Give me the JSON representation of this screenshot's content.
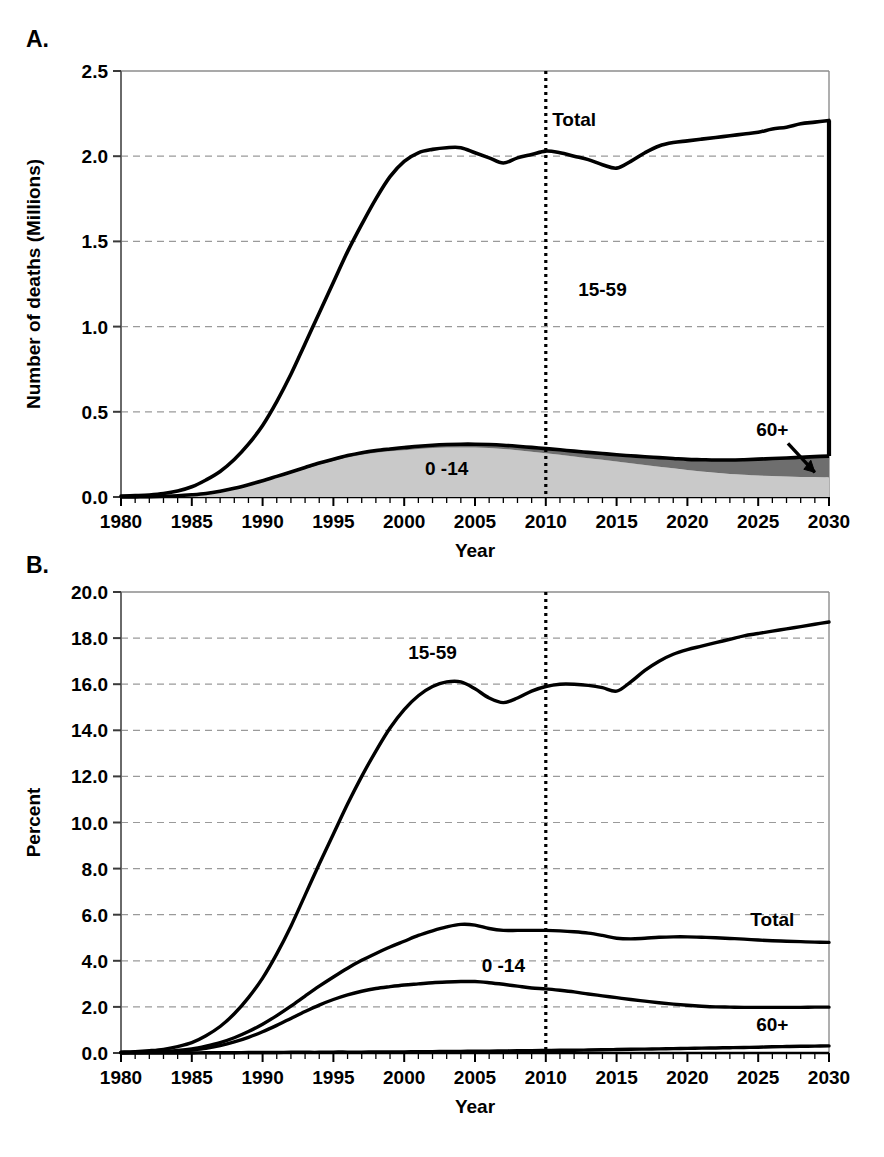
{
  "figure": {
    "background": "#ffffff",
    "line_color": "#000000",
    "grid_color": "#9a9a9a",
    "band_0_14_color": "#c9c9c9",
    "band_60plus_color": "#6e6e6e",
    "panels": [
      {
        "letter": "A."
      },
      {
        "letter": "B."
      }
    ]
  },
  "chart_data": [
    {
      "type": "area",
      "panel": "A.",
      "title": "",
      "xlabel": "Year",
      "ylabel": "Number of deaths (Millions)",
      "xlim": [
        1980,
        2030
      ],
      "ylim": [
        0.0,
        2.5
      ],
      "xticks": [
        1980,
        1985,
        1990,
        1995,
        2000,
        2005,
        2010,
        2015,
        2020,
        2025,
        2030
      ],
      "xticklabels": [
        "1980",
        "1985",
        "1990",
        "1995",
        "2000",
        "2005",
        "2010",
        "2015",
        "2020",
        "2025",
        "2030"
      ],
      "yticks": [
        0.0,
        0.5,
        1.0,
        1.5,
        2.0,
        2.5
      ],
      "yticklabels": [
        "0.0",
        "0.5",
        "1.0",
        "1.5",
        "2.0",
        "2.5"
      ],
      "minor_xtick_interval": 1,
      "grid": "horizontal-dashed",
      "legend": "inline-annotations",
      "annotations": [
        {
          "text": "Total",
          "x": 2012,
          "y": 2.18
        },
        {
          "text": "15-59",
          "x": 2014,
          "y": 1.18
        },
        {
          "text": "0 -14",
          "x": 2003,
          "y": 0.13
        },
        {
          "text": "60+",
          "x": 2026,
          "y": 0.36
        }
      ],
      "reference_line": {
        "x": 2010,
        "style": "dotted",
        "label": "2010"
      },
      "x": [
        1980,
        1981,
        1982,
        1983,
        1984,
        1985,
        1986,
        1987,
        1988,
        1989,
        1990,
        1991,
        1992,
        1993,
        1994,
        1995,
        1996,
        1997,
        1998,
        1999,
        2000,
        2001,
        2002,
        2003,
        2004,
        2005,
        2006,
        2007,
        2008,
        2009,
        2010,
        2011,
        2012,
        2013,
        2014,
        2015,
        2016,
        2017,
        2018,
        2019,
        2020,
        2021,
        2022,
        2023,
        2024,
        2025,
        2026,
        2027,
        2028,
        2029,
        2030
      ],
      "series": [
        {
          "name": "Total",
          "values": [
            0.005,
            0.008,
            0.012,
            0.02,
            0.035,
            0.06,
            0.1,
            0.15,
            0.22,
            0.31,
            0.42,
            0.56,
            0.72,
            0.9,
            1.08,
            1.26,
            1.44,
            1.6,
            1.75,
            1.88,
            1.97,
            2.02,
            2.04,
            2.05,
            2.05,
            2.02,
            1.99,
            1.96,
            1.99,
            2.01,
            2.03,
            2.02,
            2.0,
            1.98,
            1.95,
            1.93,
            1.97,
            2.02,
            2.06,
            2.08,
            2.09,
            2.1,
            2.11,
            2.12,
            2.13,
            2.14,
            2.16,
            2.17,
            2.19,
            2.2,
            2.21
          ]
        },
        {
          "name": "0-14",
          "values": [
            0.0,
            0.001,
            0.002,
            0.004,
            0.007,
            0.012,
            0.02,
            0.032,
            0.048,
            0.068,
            0.09,
            0.115,
            0.14,
            0.165,
            0.19,
            0.212,
            0.232,
            0.248,
            0.26,
            0.268,
            0.275,
            0.282,
            0.287,
            0.29,
            0.291,
            0.29,
            0.287,
            0.282,
            0.275,
            0.266,
            0.257,
            0.248,
            0.238,
            0.228,
            0.218,
            0.208,
            0.198,
            0.188,
            0.178,
            0.168,
            0.158,
            0.15,
            0.142,
            0.135,
            0.13,
            0.126,
            0.123,
            0.12,
            0.118,
            0.117,
            0.116
          ]
        },
        {
          "name": "60+",
          "values": [
            0.0,
            0.0,
            0.0,
            0.0,
            0.0,
            0.001,
            0.001,
            0.002,
            0.003,
            0.004,
            0.005,
            0.006,
            0.007,
            0.008,
            0.009,
            0.01,
            0.011,
            0.012,
            0.013,
            0.014,
            0.015,
            0.016,
            0.017,
            0.018,
            0.019,
            0.02,
            0.021,
            0.022,
            0.023,
            0.025,
            0.027,
            0.029,
            0.031,
            0.034,
            0.037,
            0.04,
            0.044,
            0.048,
            0.053,
            0.058,
            0.063,
            0.069,
            0.075,
            0.082,
            0.089,
            0.096,
            0.103,
            0.109,
            0.115,
            0.12,
            0.124
          ]
        }
      ]
    },
    {
      "type": "line",
      "panel": "B.",
      "title": "",
      "xlabel": "Year",
      "ylabel": "Percent",
      "xlim": [
        1980,
        2030
      ],
      "ylim": [
        0.0,
        20.0
      ],
      "xticks": [
        1980,
        1985,
        1990,
        1995,
        2000,
        2005,
        2010,
        2015,
        2020,
        2025,
        2030
      ],
      "xticklabels": [
        "1980",
        "1985",
        "1990",
        "1995",
        "2000",
        "2005",
        "2010",
        "2015",
        "2020",
        "2025",
        "2030"
      ],
      "yticks": [
        0.0,
        2.0,
        4.0,
        6.0,
        8.0,
        10.0,
        12.0,
        14.0,
        16.0,
        18.0,
        20.0
      ],
      "yticklabels": [
        "0.0",
        "2.0",
        "4.0",
        "6.0",
        "8.0",
        "10.0",
        "12.0",
        "14.0",
        "16.0",
        "18.0",
        "20.0"
      ],
      "minor_xtick_interval": 1,
      "grid": "horizontal-dashed",
      "legend": "inline-annotations",
      "annotations": [
        {
          "text": "15-59",
          "x": 2002,
          "y": 17.1
        },
        {
          "text": "Total",
          "x": 2026,
          "y": 5.5
        },
        {
          "text": "0 -14",
          "x": 2007,
          "y": 3.5
        },
        {
          "text": "60+",
          "x": 2026,
          "y": 0.95
        }
      ],
      "reference_line": {
        "x": 2010,
        "style": "dotted",
        "label": "2010"
      },
      "x": [
        1980,
        1981,
        1982,
        1983,
        1984,
        1985,
        1986,
        1987,
        1988,
        1989,
        1990,
        1991,
        1992,
        1993,
        1994,
        1995,
        1996,
        1997,
        1998,
        1999,
        2000,
        2001,
        2002,
        2003,
        2004,
        2005,
        2006,
        2007,
        2008,
        2009,
        2010,
        2011,
        2012,
        2013,
        2014,
        2015,
        2016,
        2017,
        2018,
        2019,
        2020,
        2021,
        2022,
        2023,
        2024,
        2025,
        2026,
        2027,
        2028,
        2029,
        2030
      ],
      "series": [
        {
          "name": "15-59",
          "values": [
            0.04,
            0.06,
            0.1,
            0.16,
            0.28,
            0.45,
            0.75,
            1.15,
            1.7,
            2.4,
            3.25,
            4.3,
            5.5,
            6.85,
            8.2,
            9.5,
            10.8,
            12.0,
            13.1,
            14.1,
            14.9,
            15.5,
            15.9,
            16.1,
            16.1,
            15.8,
            15.4,
            15.2,
            15.4,
            15.7,
            15.9,
            16.0,
            16.0,
            15.95,
            15.85,
            15.7,
            16.1,
            16.6,
            17.0,
            17.3,
            17.5,
            17.65,
            17.8,
            17.95,
            18.1,
            18.2,
            18.3,
            18.4,
            18.5,
            18.6,
            18.7
          ]
        },
        {
          "name": "Total",
          "values": [
            0.02,
            0.03,
            0.04,
            0.07,
            0.11,
            0.18,
            0.3,
            0.45,
            0.66,
            0.93,
            1.25,
            1.62,
            2.03,
            2.47,
            2.9,
            3.3,
            3.68,
            4.02,
            4.32,
            4.6,
            4.85,
            5.1,
            5.3,
            5.47,
            5.58,
            5.55,
            5.4,
            5.32,
            5.32,
            5.32,
            5.32,
            5.3,
            5.26,
            5.2,
            5.1,
            4.98,
            4.95,
            4.98,
            5.02,
            5.04,
            5.04,
            5.02,
            5.0,
            4.97,
            4.94,
            4.9,
            4.87,
            4.85,
            4.83,
            4.81,
            4.8
          ]
        },
        {
          "name": "0-14",
          "values": [
            0.01,
            0.02,
            0.03,
            0.05,
            0.08,
            0.13,
            0.2,
            0.32,
            0.48,
            0.68,
            0.92,
            1.2,
            1.5,
            1.8,
            2.08,
            2.32,
            2.52,
            2.68,
            2.8,
            2.88,
            2.95,
            3.0,
            3.05,
            3.08,
            3.1,
            3.1,
            3.05,
            2.98,
            2.9,
            2.82,
            2.78,
            2.72,
            2.65,
            2.56,
            2.48,
            2.4,
            2.32,
            2.25,
            2.18,
            2.12,
            2.07,
            2.03,
            2.0,
            1.99,
            1.98,
            1.98,
            1.98,
            1.98,
            1.98,
            1.99,
            1.99
          ]
        },
        {
          "name": "60+",
          "values": [
            0.0,
            0.0,
            0.0,
            0.0,
            0.0,
            0.0,
            0.01,
            0.01,
            0.01,
            0.02,
            0.02,
            0.02,
            0.03,
            0.03,
            0.03,
            0.04,
            0.04,
            0.04,
            0.05,
            0.05,
            0.05,
            0.06,
            0.06,
            0.07,
            0.07,
            0.08,
            0.08,
            0.09,
            0.1,
            0.1,
            0.11,
            0.12,
            0.12,
            0.13,
            0.14,
            0.15,
            0.16,
            0.17,
            0.18,
            0.19,
            0.2,
            0.21,
            0.22,
            0.23,
            0.24,
            0.25,
            0.27,
            0.28,
            0.29,
            0.3,
            0.31
          ]
        }
      ]
    }
  ]
}
